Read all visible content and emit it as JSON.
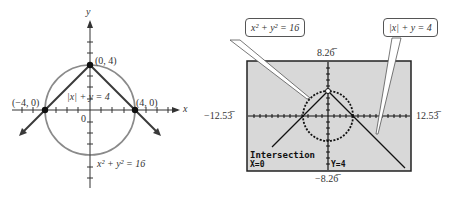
{
  "left_graph": {
    "axis_x_label": "x",
    "axis_y_label": "y",
    "origin_label": "0",
    "points": [
      {
        "label": "(0, 4)",
        "x": 0,
        "y": 4
      },
      {
        "label": "(−4, 0)",
        "x": -4,
        "y": 0
      },
      {
        "label": "(4, 0)",
        "x": 4,
        "y": 0
      }
    ],
    "equation_abs": "|x| + y = 4",
    "equation_circle": "x² + y² = 16",
    "colors": {
      "circle": "#8a8a8a",
      "lines": "#3a3a3a",
      "points": "#111111"
    }
  },
  "calculator": {
    "callout_circle": "x² + y² = 16",
    "callout_abs": "|x| + y = 4",
    "window": {
      "ymax": "8.26̅",
      "ymin": "−8.26̅",
      "xmin": "−12.53̅",
      "xmax": "12.53̅"
    },
    "status_title": "Intersection",
    "status_x": "X=0",
    "status_y": "Y=4",
    "colors": {
      "screen_bg": "#d8d8d8",
      "frame": "#222222"
    }
  }
}
